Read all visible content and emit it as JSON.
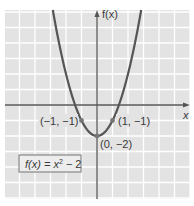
{
  "chart_data": {
    "type": "line",
    "title": "",
    "function_label": "f(x) = x² − 2",
    "function_label_parts": {
      "lhs": "f(x) = x",
      "exp": "2",
      "rhs": " − 2"
    },
    "xlabel": "x",
    "ylabel": "f(x)",
    "xlim": [
      -6,
      6
    ],
    "ylim": [
      -6,
      6
    ],
    "grid": true,
    "series": [
      {
        "name": "f(x) = x^2 - 2",
        "x": [
          -2.86,
          -2,
          -1,
          0,
          1,
          2,
          2.86
        ],
        "y": [
          6.18,
          2,
          -1,
          -2,
          -1,
          2,
          6.18
        ]
      }
    ],
    "annotations": [
      {
        "text": "(−1, −1)",
        "x": -1,
        "y": -1
      },
      {
        "text": "(1, −1)",
        "x": 1,
        "y": -1
      },
      {
        "text": "(0, −2)",
        "x": 0,
        "y": -2
      }
    ]
  },
  "colors": {
    "background": "#e3e3e3",
    "grid": "#ffffff",
    "axis": "#555555",
    "curve": "#555555",
    "point": "#777777",
    "label_box": "#eeeeee",
    "label_border": "#888888"
  }
}
